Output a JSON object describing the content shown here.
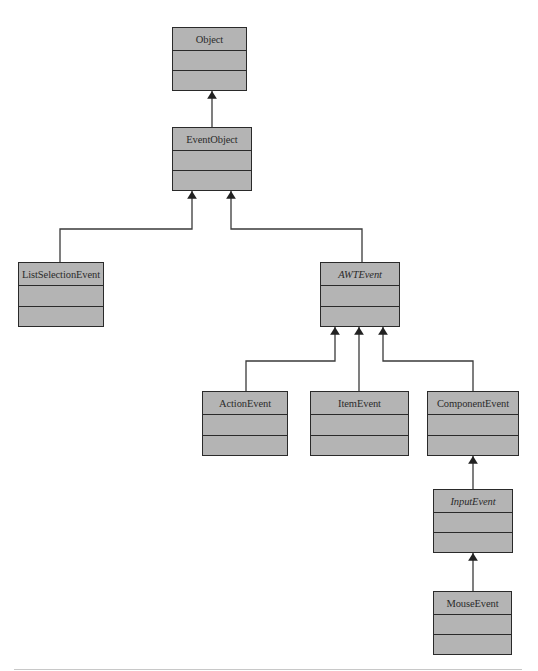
{
  "diagram": {
    "type": "uml-class-hierarchy",
    "classes": [
      {
        "id": "Object",
        "name": "Object",
        "abstract": false
      },
      {
        "id": "EventObject",
        "name": "EventObject",
        "abstract": false
      },
      {
        "id": "ListSelectionEvent",
        "name": "ListSelectionEvent",
        "abstract": false
      },
      {
        "id": "AWTEvent",
        "name": "AWTEvent",
        "abstract": true
      },
      {
        "id": "ActionEvent",
        "name": "ActionEvent",
        "abstract": false
      },
      {
        "id": "ItemEvent",
        "name": "ItemEvent",
        "abstract": false
      },
      {
        "id": "ComponentEvent",
        "name": "ComponentEvent",
        "abstract": false
      },
      {
        "id": "InputEvent",
        "name": "InputEvent",
        "abstract": true
      },
      {
        "id": "MouseEvent",
        "name": "MouseEvent",
        "abstract": false
      }
    ],
    "inheritance": [
      {
        "child": "EventObject",
        "parent": "Object"
      },
      {
        "child": "ListSelectionEvent",
        "parent": "EventObject"
      },
      {
        "child": "AWTEvent",
        "parent": "EventObject"
      },
      {
        "child": "ActionEvent",
        "parent": "AWTEvent"
      },
      {
        "child": "ItemEvent",
        "parent": "AWTEvent"
      },
      {
        "child": "ComponentEvent",
        "parent": "AWTEvent"
      },
      {
        "child": "InputEvent",
        "parent": "ComponentEvent"
      },
      {
        "child": "MouseEvent",
        "parent": "InputEvent"
      }
    ],
    "colors": {
      "box_fill": "#b4b4b4",
      "border": "#2a2a2a",
      "link": "#3a3a3a"
    }
  }
}
